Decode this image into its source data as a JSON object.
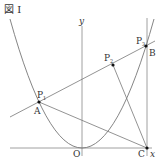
{
  "figure": {
    "title": "図 I",
    "axes": {
      "x_label": "x",
      "y_label": "y",
      "origin_label": "O"
    },
    "points": {
      "A": {
        "label": "A",
        "px": 39,
        "py": 102
      },
      "B": {
        "label": "B",
        "px": 146,
        "py": 46
      },
      "C": {
        "label": "C",
        "px": 147,
        "py": 148
      },
      "O": {
        "label": "O",
        "px": 82,
        "py": 148
      },
      "P1": {
        "label": "P",
        "sub": "1",
        "px": 39,
        "py": 102
      },
      "P2": {
        "label": "P",
        "sub": "2",
        "px": 113,
        "py": 65
      },
      "P3": {
        "label": "P",
        "sub": "3",
        "px": 146,
        "py": 46
      }
    },
    "elements": [
      "parabola through O, A, B",
      "line AB (through P1, P2, P3)",
      "segment A–C",
      "segment P2–C",
      "vertical line through C and B"
    ],
    "colors": {
      "line": "#777777",
      "point": "#111111",
      "text": "#333333"
    }
  }
}
